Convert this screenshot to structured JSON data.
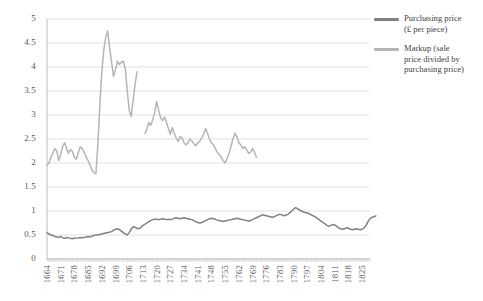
{
  "chart_data": {
    "type": "line",
    "title": "",
    "xlabel": "",
    "ylabel": "£ per piece",
    "ylim": [
      0,
      5
    ],
    "ytick_values": [
      "0",
      "0.5",
      "1",
      "1.5",
      "2",
      "2.5",
      "3",
      "3.5",
      "4",
      "4.5",
      "5"
    ],
    "xlim": [
      1664,
      1829
    ],
    "grid": "horizontal",
    "legend_position": "right",
    "xtick_labels": [
      "1664",
      "1671",
      "1678",
      "1685",
      "1692",
      "1699",
      "1706",
      "1713",
      "1720",
      "1727",
      "1734",
      "1741",
      "1748",
      "1755",
      "1762",
      "1769",
      "1776",
      "1783",
      "1790",
      "1797",
      "1804",
      "1811",
      "1818",
      "1825"
    ],
    "colors": {
      "purchasing_price": "#808080",
      "markup": "#b5b5b5",
      "grid": "#d9d9d9",
      "axis": "#bfbfbf",
      "text": "#595959"
    },
    "series": [
      {
        "name": "Purchasing price (£ per piece)",
        "color": "#808080",
        "x_start": 1664,
        "values": [
          0.55,
          0.52,
          0.5,
          0.49,
          0.47,
          0.46,
          0.45,
          0.47,
          0.44,
          0.43,
          0.45,
          0.44,
          0.43,
          0.42,
          0.44,
          0.43,
          0.44,
          0.45,
          0.44,
          0.45,
          0.46,
          0.47,
          0.46,
          0.48,
          0.49,
          0.5,
          0.5,
          0.51,
          0.52,
          0.53,
          0.54,
          0.55,
          0.56,
          0.57,
          0.6,
          0.62,
          0.63,
          0.61,
          0.58,
          0.55,
          0.52,
          0.5,
          0.55,
          0.62,
          0.67,
          0.66,
          0.64,
          0.63,
          0.66,
          0.7,
          0.72,
          0.75,
          0.78,
          0.8,
          0.82,
          0.83,
          0.83,
          0.82,
          0.83,
          0.84,
          0.83,
          0.82,
          0.83,
          0.82,
          0.83,
          0.85,
          0.86,
          0.85,
          0.84,
          0.85,
          0.86,
          0.85,
          0.84,
          0.83,
          0.82,
          0.8,
          0.78,
          0.76,
          0.75,
          0.76,
          0.78,
          0.8,
          0.82,
          0.84,
          0.85,
          0.84,
          0.83,
          0.81,
          0.8,
          0.79,
          0.78,
          0.79,
          0.8,
          0.81,
          0.82,
          0.83,
          0.84,
          0.85,
          0.84,
          0.83,
          0.82,
          0.81,
          0.8,
          0.79,
          0.8,
          0.82,
          0.84,
          0.86,
          0.88,
          0.9,
          0.92,
          0.91,
          0.9,
          0.89,
          0.88,
          0.87,
          0.88,
          0.9,
          0.92,
          0.93,
          0.92,
          0.9,
          0.91,
          0.93,
          0.96,
          1.0,
          1.04,
          1.07,
          1.05,
          1.02,
          1.0,
          0.98,
          0.97,
          0.96,
          0.94,
          0.92,
          0.9,
          0.88,
          0.85,
          0.82,
          0.79,
          0.76,
          0.73,
          0.7,
          0.68,
          0.7,
          0.72,
          0.71,
          0.68,
          0.65,
          0.63,
          0.62,
          0.63,
          0.65,
          0.64,
          0.62,
          0.61,
          0.62,
          0.63,
          0.62,
          0.61,
          0.62,
          0.65,
          0.7,
          0.78,
          0.84,
          0.87,
          0.88,
          0.9
        ]
      },
      {
        "name": "Markup (sale price divided by purchasing price)",
        "color": "#b5b5b5",
        "x_start": 1664,
        "values": [
          1.95,
          2.0,
          2.12,
          2.2,
          2.3,
          2.25,
          2.05,
          2.18,
          2.35,
          2.42,
          2.3,
          2.2,
          2.28,
          2.24,
          2.12,
          2.08,
          2.22,
          2.34,
          2.3,
          2.22,
          2.12,
          2.05,
          1.95,
          1.85,
          1.8,
          1.78,
          2.4,
          3.2,
          3.9,
          4.35,
          4.62,
          4.75,
          4.4,
          4.1,
          3.8,
          3.95,
          4.12,
          4.05,
          4.1,
          4.12,
          3.95,
          3.5,
          3.1,
          2.97,
          3.3,
          3.65,
          3.9,
          null,
          null,
          null,
          2.62,
          2.7,
          2.85,
          2.78,
          2.9,
          3.05,
          3.28,
          3.1,
          2.95,
          2.88,
          2.96,
          2.85,
          2.72,
          2.6,
          2.74,
          2.62,
          2.52,
          2.45,
          2.55,
          2.52,
          2.42,
          2.38,
          2.42,
          2.5,
          2.46,
          2.4,
          2.36,
          2.42,
          2.45,
          2.52,
          2.6,
          2.72,
          2.62,
          2.5,
          2.42,
          2.38,
          2.3,
          2.22,
          2.18,
          2.12,
          2.05,
          2.0,
          2.1,
          2.2,
          2.35,
          2.5,
          2.62,
          2.55,
          2.42,
          2.38,
          2.3,
          2.34,
          2.28,
          2.2,
          2.22,
          2.3,
          2.22,
          2.12
        ]
      }
    ]
  },
  "legend": {
    "items": [
      {
        "label_line1": "Purchasing price",
        "label_line2": "(£ per piece)"
      },
      {
        "label_line1": "Markup (sale",
        "label_line2": "price divided by",
        "label_line3": "purchasing price)"
      }
    ]
  },
  "axis": {
    "y_title": "£ per piece"
  }
}
